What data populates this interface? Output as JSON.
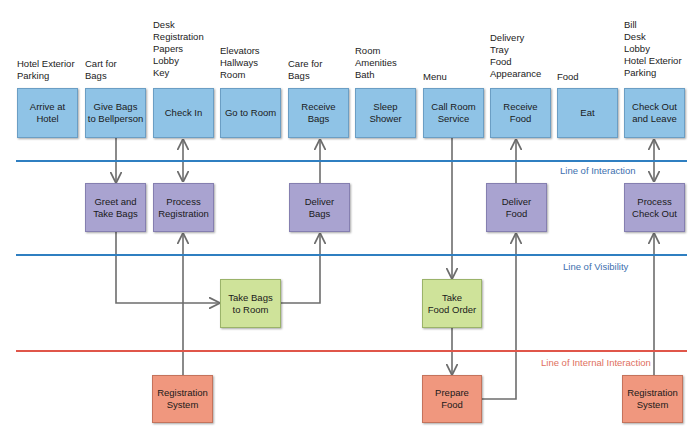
{
  "colors": {
    "customer_action": "#8fc3e6",
    "onstage_action": "#a9a3d0",
    "backstage_action": "#cfe39a",
    "support_process": "#f0977e",
    "interaction_line": "#2f7fc1",
    "visibility_line": "#2f7fc1",
    "internal_line": "#e0564a",
    "connector": "#6d6d6d"
  },
  "physical_evidence": [
    "Hotel Exterior\nParking",
    "Cart for\nBags",
    "Desk\nRegistration\nPapers\nLobby\nKey",
    "Elevators\nHallways\nRoom",
    "Care for\nBags",
    "Room\nAmenities\nBath",
    "Menu",
    "Delivery\nTray\nFood\nAppearance",
    "Food",
    "Bill\nDesk\nLobby\nHotel Exterior\nParking"
  ],
  "customer_actions": [
    "Arrive at\nHotel",
    "Give Bags\nto Bellperson",
    "Check In",
    "Go to Room",
    "Receive\nBags",
    "Sleep\nShower",
    "Call Room\nService",
    "Receive\nFood",
    "Eat",
    "Check Out\nand Leave"
  ],
  "onstage_actions": {
    "greet": "Greet and\nTake Bags",
    "process_registration": "Process\nRegistration",
    "deliver_bags": "Deliver\nBags",
    "deliver_food": "Deliver\nFood",
    "process_checkout": "Process\nCheck Out"
  },
  "backstage_actions": {
    "take_bags": "Take Bags\nto Room",
    "take_food_order": "Take\nFood Order"
  },
  "support_processes": {
    "registration_1": "Registration\nSystem",
    "prepare_food": "Prepare\nFood",
    "registration_2": "Registration\nSystem"
  },
  "lines": {
    "interaction": "Line of Interaction",
    "visibility": "Line of Visibility",
    "internal": "Line of Internal Interaction"
  }
}
